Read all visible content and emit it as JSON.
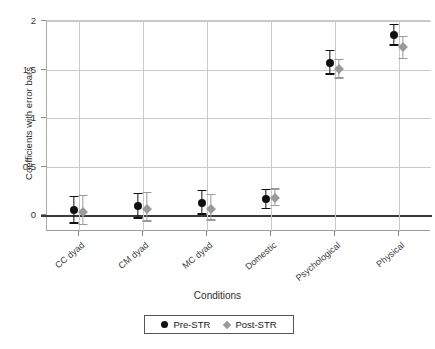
{
  "chart_data": {
    "type": "scatter",
    "title": "",
    "xlabel": "Conditions",
    "ylabel": "Coefficients with error bars",
    "categories": [
      "CC dyad",
      "CM dyad",
      "MC dyad",
      "Domestic",
      "Psychological",
      "Physical"
    ],
    "ylim": [
      -0.17,
      2.0
    ],
    "yticks": [
      0,
      0.5,
      1,
      1.5,
      2
    ],
    "ytick_labels": [
      "0",
      "0.5",
      "1",
      "1.5",
      "2"
    ],
    "grid": true,
    "legend_position": "bottom-center",
    "reference_line": 0,
    "series": [
      {
        "name": "Pre-STR",
        "marker": "circle",
        "color": "#101010",
        "values": [
          0.05,
          0.09,
          0.12,
          0.16,
          1.56,
          1.85
        ],
        "err_low": [
          -0.08,
          -0.03,
          0.01,
          0.07,
          1.45,
          1.75
        ],
        "err_high": [
          0.19,
          0.22,
          0.25,
          0.26,
          1.69,
          1.96
        ]
      },
      {
        "name": "Post-STR",
        "marker": "diamond",
        "color": "#9a9a9a",
        "values": [
          0.03,
          0.06,
          0.06,
          0.17,
          1.5,
          1.72
        ],
        "err_low": [
          -0.1,
          -0.06,
          -0.05,
          0.1,
          1.41,
          1.61
        ],
        "err_high": [
          0.2,
          0.23,
          0.21,
          0.27,
          1.6,
          1.84
        ]
      }
    ]
  },
  "legend": {
    "items": [
      {
        "label": "Pre-STR",
        "marker": "circle",
        "color": "#101010"
      },
      {
        "label": "Post-STR",
        "marker": "diamond",
        "color": "#9a9a9a"
      }
    ]
  },
  "axis": {
    "y_title": "Coefficients with error bars",
    "x_title": "Conditions"
  },
  "colors": {
    "pre": "#101010",
    "post": "#9a9a9a",
    "grid": "#c9c9c9",
    "axis": "#9a9a9a",
    "zero_line": "#3a3a3a",
    "background": "#ffffff"
  }
}
